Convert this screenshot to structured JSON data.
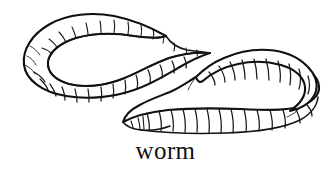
{
  "figure": {
    "kind": "line-drawing",
    "subject": "worm",
    "caption": "worm",
    "background_color": "#ffffff",
    "ink_color": "#101010",
    "style": "black-and-white pen-and-ink illustration",
    "canvas": {
      "width": 331,
      "height": 171
    },
    "illustration": {
      "name": "earthworm",
      "description": "An S-curved segmented earthworm drawn in black outline with ring-like body segments, coiling from a tapered tip at upper middle, looping left, sweeping right, and ending in a tapered tail at lower middle.",
      "segment_count_visible": 48,
      "tapered_tips": 2
    }
  },
  "caption": {
    "label": "worm",
    "font_style": "serif",
    "font_size_px": 25,
    "align": "center"
  }
}
